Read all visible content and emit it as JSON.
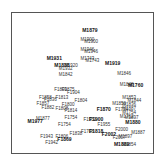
{
  "chart_data": {
    "type": "scatter",
    "title": "",
    "xlabel": "",
    "ylabel": "",
    "grid": false,
    "legend": null,
    "xlim": [
      0,
      100
    ],
    "ylim": [
      0,
      100
    ],
    "points": [
      {
        "label": "M1879",
        "x": 55,
        "y": 93,
        "bold": true
      },
      {
        "label": "M1900",
        "x": 53,
        "y": 86
      },
      {
        "label": "M1900",
        "x": 56,
        "y": 84
      },
      {
        "label": "M1946",
        "x": 53,
        "y": 78
      },
      {
        "label": "M1946",
        "x": 56,
        "y": 76
      },
      {
        "label": "M1743",
        "x": 53,
        "y": 71
      },
      {
        "label": "M1743",
        "x": 57,
        "y": 69
      },
      {
        "label": "M1931",
        "x": 27,
        "y": 71,
        "bold": true
      },
      {
        "label": "M1919",
        "x": 73,
        "y": 67,
        "bold": true
      },
      {
        "label": "M1838",
        "x": 33,
        "y": 65,
        "bold": true
      },
      {
        "label": "M1920",
        "x": 40,
        "y": 65
      },
      {
        "label": "M1932",
        "x": 36,
        "y": 63
      },
      {
        "label": "M1842",
        "x": 36,
        "y": 58
      },
      {
        "label": "M1846",
        "x": 82,
        "y": 59
      },
      {
        "label": "M1848",
        "x": 84,
        "y": 50
      },
      {
        "label": "M1760",
        "x": 91,
        "y": 49,
        "bold": true
      },
      {
        "label": "F1809",
        "x": 32,
        "y": 46
      },
      {
        "label": "F1875",
        "x": 38,
        "y": 46
      },
      {
        "label": "F1904",
        "x": 42,
        "y": 44
      },
      {
        "label": "F1858",
        "x": 20,
        "y": 40
      },
      {
        "label": "F1813",
        "x": 33,
        "y": 40
      },
      {
        "label": "F1836",
        "x": 24,
        "y": 38
      },
      {
        "label": "F1804",
        "x": 48,
        "y": 37
      },
      {
        "label": "F1857",
        "x": 18,
        "y": 35
      },
      {
        "label": "F1800",
        "x": 38,
        "y": 34
      },
      {
        "label": "F1882",
        "x": 22,
        "y": 32
      },
      {
        "label": "F1808",
        "x": 33,
        "y": 31
      },
      {
        "label": "F1814",
        "x": 40,
        "y": 29
      },
      {
        "label": "M1853",
        "x": 86,
        "y": 40
      },
      {
        "label": "M1844",
        "x": 90,
        "y": 37
      },
      {
        "label": "M1856",
        "x": 78,
        "y": 35
      },
      {
        "label": "M1836",
        "x": 86,
        "y": 34
      },
      {
        "label": "M1887",
        "x": 86,
        "y": 31
      },
      {
        "label": "F1870",
        "x": 66,
        "y": 30,
        "bold": true
      },
      {
        "label": "F1734",
        "x": 80,
        "y": 30
      },
      {
        "label": "M1754",
        "x": 86,
        "y": 28
      },
      {
        "label": "M1762",
        "x": 84,
        "y": 25
      },
      {
        "label": "M1897",
        "x": 88,
        "y": 24
      },
      {
        "label": "M1880",
        "x": 89,
        "y": 20,
        "bold": true
      },
      {
        "label": "F1754",
        "x": 40,
        "y": 24
      },
      {
        "label": "M1977",
        "x": 12,
        "y": 21,
        "bold": true
      },
      {
        "label": "M1877",
        "x": 18,
        "y": 23
      },
      {
        "label": "F1754",
        "x": 35,
        "y": 18
      },
      {
        "label": "F1952",
        "x": 55,
        "y": 22
      },
      {
        "label": "F1900",
        "x": 60,
        "y": 22,
        "bold": true
      },
      {
        "label": "F1955",
        "x": 66,
        "y": 18
      },
      {
        "label": "F1708",
        "x": 53,
        "y": 13
      },
      {
        "label": "F1818",
        "x": 60,
        "y": 13,
        "bold": true
      },
      {
        "label": "F1838",
        "x": 44,
        "y": 11
      },
      {
        "label": "F1943",
        "x": 21,
        "y": 9
      },
      {
        "label": "F1806",
        "x": 33,
        "y": 9
      },
      {
        "label": "F1942",
        "x": 25,
        "y": 4
      },
      {
        "label": "F1869",
        "x": 35,
        "y": 6,
        "bold": true
      },
      {
        "label": "F2000",
        "x": 80,
        "y": 14
      },
      {
        "label": "M1887",
        "x": 93,
        "y": 12
      },
      {
        "label": "F2002",
        "x": 70,
        "y": 10,
        "bold": true
      },
      {
        "label": "F2007",
        "x": 78,
        "y": 8
      },
      {
        "label": "M1897",
        "x": 83,
        "y": 9
      },
      {
        "label": "M1889",
        "x": 80,
        "y": 2,
        "bold": true
      },
      {
        "label": "M1854",
        "x": 86,
        "y": 2
      }
    ]
  }
}
